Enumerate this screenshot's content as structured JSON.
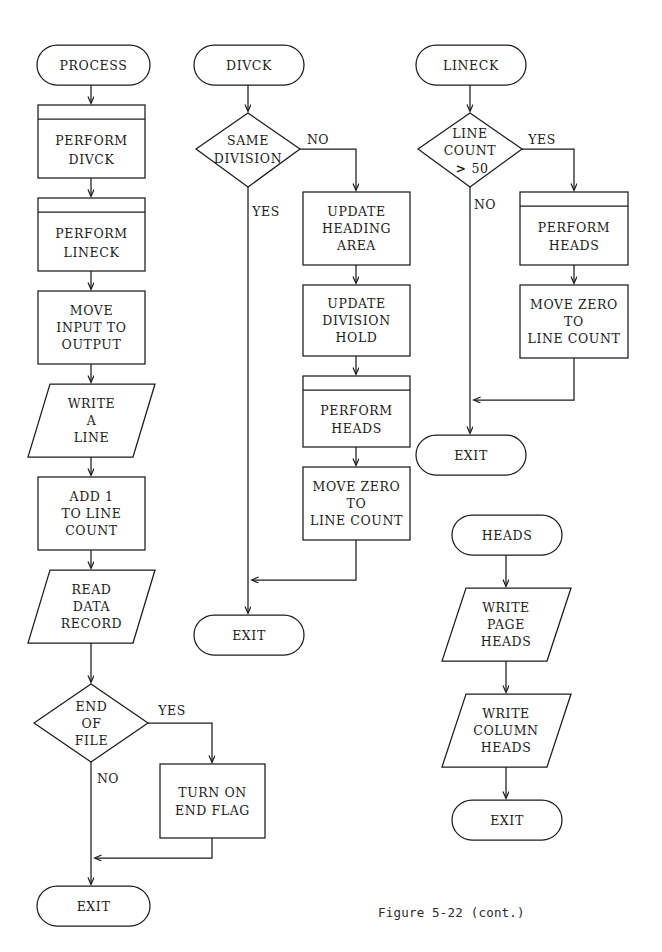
{
  "figure": {
    "caption": "Figure 5-22 (cont.)",
    "caption_x": 378,
    "caption_y": 905
  },
  "chart_data": {
    "type": "diagram",
    "diagram_kind": "flowchart",
    "title": "Figure 5-22 (cont.)",
    "shape_legend": {
      "terminal": "rounded stadium = routine entry / EXIT",
      "process": "rectangle = processing step",
      "predefined_process": "rectangle with top bar = PERFORM (subroutine call)",
      "io": "parallelogram = input/output (READ/WRITE)",
      "decision": "diamond = conditional branch"
    },
    "routines": [
      {
        "name": "PROCESS",
        "column": 1,
        "nodes": [
          {
            "id": "p_start",
            "type": "terminal",
            "lines": [
              "PROCESS"
            ]
          },
          {
            "id": "p_divck",
            "type": "predefined_process",
            "lines": [
              "PERFORM",
              "DIVCK"
            ]
          },
          {
            "id": "p_lineck",
            "type": "predefined_process",
            "lines": [
              "PERFORM",
              "LINECK"
            ]
          },
          {
            "id": "p_move",
            "type": "process",
            "lines": [
              "MOVE",
              "INPUT TO",
              "OUTPUT"
            ]
          },
          {
            "id": "p_write",
            "type": "io",
            "lines": [
              "WRITE",
              "A",
              "LINE"
            ]
          },
          {
            "id": "p_add",
            "type": "process",
            "lines": [
              "ADD 1",
              "TO LINE",
              "COUNT"
            ]
          },
          {
            "id": "p_read",
            "type": "io",
            "lines": [
              "READ",
              "DATA",
              "RECORD"
            ]
          },
          {
            "id": "p_eof",
            "type": "decision",
            "lines": [
              "END",
              "OF",
              "FILE"
            ]
          },
          {
            "id": "p_flag",
            "type": "process",
            "lines": [
              "TURN ON",
              "END FLAG"
            ]
          },
          {
            "id": "p_exit",
            "type": "terminal",
            "lines": [
              "EXIT"
            ]
          }
        ],
        "edges": [
          {
            "from": "p_start",
            "to": "p_divck",
            "label": ""
          },
          {
            "from": "p_divck",
            "to": "p_lineck",
            "label": ""
          },
          {
            "from": "p_lineck",
            "to": "p_move",
            "label": ""
          },
          {
            "from": "p_move",
            "to": "p_write",
            "label": ""
          },
          {
            "from": "p_write",
            "to": "p_add",
            "label": ""
          },
          {
            "from": "p_add",
            "to": "p_read",
            "label": ""
          },
          {
            "from": "p_read",
            "to": "p_eof",
            "label": ""
          },
          {
            "from": "p_eof",
            "to": "p_flag",
            "label": "YES"
          },
          {
            "from": "p_eof",
            "to": "p_exit",
            "label": "NO"
          },
          {
            "from": "p_flag",
            "to": "p_exit",
            "label": ""
          }
        ]
      },
      {
        "name": "DIVCK",
        "column": 2,
        "nodes": [
          {
            "id": "d_start",
            "type": "terminal",
            "lines": [
              "DIVCK"
            ]
          },
          {
            "id": "d_same",
            "type": "decision",
            "lines": [
              "SAME",
              "DIVISION"
            ]
          },
          {
            "id": "d_head",
            "type": "process",
            "lines": [
              "UPDATE",
              "HEADING",
              "AREA"
            ]
          },
          {
            "id": "d_hold",
            "type": "process",
            "lines": [
              "UPDATE",
              "DIVISION",
              "HOLD"
            ]
          },
          {
            "id": "d_heads",
            "type": "predefined_process",
            "lines": [
              "PERFORM",
              "HEADS"
            ]
          },
          {
            "id": "d_zero",
            "type": "process",
            "lines": [
              "MOVE ZERO",
              "TO",
              "LINE COUNT"
            ]
          },
          {
            "id": "d_exit",
            "type": "terminal",
            "lines": [
              "EXIT"
            ]
          }
        ],
        "edges": [
          {
            "from": "d_start",
            "to": "d_same",
            "label": ""
          },
          {
            "from": "d_same",
            "to": "d_head",
            "label": "NO"
          },
          {
            "from": "d_same",
            "to": "d_exit",
            "label": "YES"
          },
          {
            "from": "d_head",
            "to": "d_hold",
            "label": ""
          },
          {
            "from": "d_hold",
            "to": "d_heads",
            "label": ""
          },
          {
            "from": "d_heads",
            "to": "d_zero",
            "label": ""
          },
          {
            "from": "d_zero",
            "to": "d_exit",
            "label": ""
          }
        ]
      },
      {
        "name": "LINECK",
        "column": 3,
        "nodes": [
          {
            "id": "l_start",
            "type": "terminal",
            "lines": [
              "LINECK"
            ]
          },
          {
            "id": "l_cnt",
            "type": "decision",
            "lines": [
              "LINE",
              "COUNT",
              "> 50"
            ]
          },
          {
            "id": "l_heads",
            "type": "predefined_process",
            "lines": [
              "PERFORM",
              "HEADS"
            ]
          },
          {
            "id": "l_zero",
            "type": "process",
            "lines": [
              "MOVE ZERO",
              "TO",
              "LINE COUNT"
            ]
          },
          {
            "id": "l_exit",
            "type": "terminal",
            "lines": [
              "EXIT"
            ]
          }
        ],
        "edges": [
          {
            "from": "l_start",
            "to": "l_cnt",
            "label": ""
          },
          {
            "from": "l_cnt",
            "to": "l_heads",
            "label": "YES"
          },
          {
            "from": "l_cnt",
            "to": "l_exit",
            "label": "NO"
          },
          {
            "from": "l_heads",
            "to": "l_zero",
            "label": ""
          },
          {
            "from": "l_zero",
            "to": "l_exit",
            "label": ""
          }
        ]
      },
      {
        "name": "HEADS",
        "column": 3,
        "nodes": [
          {
            "id": "h_start",
            "type": "terminal",
            "lines": [
              "HEADS"
            ]
          },
          {
            "id": "h_page",
            "type": "io",
            "lines": [
              "WRITE",
              "PAGE",
              "HEADS"
            ]
          },
          {
            "id": "h_col",
            "type": "io",
            "lines": [
              "WRITE",
              "COLUMN",
              "HEADS"
            ]
          },
          {
            "id": "h_exit",
            "type": "terminal",
            "lines": [
              "EXIT"
            ]
          }
        ],
        "edges": [
          {
            "from": "h_start",
            "to": "h_page",
            "label": ""
          },
          {
            "from": "h_page",
            "to": "h_col",
            "label": ""
          },
          {
            "from": "h_col",
            "to": "h_exit",
            "label": ""
          }
        ]
      }
    ]
  },
  "nodes": {
    "p_start": {
      "label": "PROCESS"
    },
    "p_divck": {
      "l1": "PERFORM",
      "l2": "DIVCK"
    },
    "p_lineck": {
      "l1": "PERFORM",
      "l2": "LINECK"
    },
    "p_move": {
      "l1": "MOVE",
      "l2": "INPUT TO",
      "l3": "OUTPUT"
    },
    "p_write": {
      "l1": "WRITE",
      "l2": "A",
      "l3": "LINE"
    },
    "p_add": {
      "l1": "ADD 1",
      "l2": "TO LINE",
      "l3": "COUNT"
    },
    "p_read": {
      "l1": "READ",
      "l2": "DATA",
      "l3": "RECORD"
    },
    "p_eof": {
      "l1": "END",
      "l2": "OF",
      "l3": "FILE"
    },
    "p_flag": {
      "l1": "TURN ON",
      "l2": "END FLAG"
    },
    "p_exit": {
      "label": "EXIT"
    },
    "d_start": {
      "label": "DIVCK"
    },
    "d_same": {
      "l1": "SAME",
      "l2": "DIVISION"
    },
    "d_head": {
      "l1": "UPDATE",
      "l2": "HEADING",
      "l3": "AREA"
    },
    "d_hold": {
      "l1": "UPDATE",
      "l2": "DIVISION",
      "l3": "HOLD"
    },
    "d_heads": {
      "l1": "PERFORM",
      "l2": "HEADS"
    },
    "d_zero": {
      "l1": "MOVE ZERO",
      "l2": "TO",
      "l3": "LINE COUNT"
    },
    "d_exit": {
      "label": "EXIT"
    },
    "l_start": {
      "label": "LINECK"
    },
    "l_cnt": {
      "l1": "LINE",
      "l2": "COUNT",
      "l3gt": ">",
      "l3num": "50"
    },
    "l_heads": {
      "l1": "PERFORM",
      "l2": "HEADS"
    },
    "l_zero": {
      "l1": "MOVE ZERO",
      "l2": "TO",
      "l3": "LINE COUNT"
    },
    "l_exit": {
      "label": "EXIT"
    },
    "h_start": {
      "label": "HEADS"
    },
    "h_page": {
      "l1": "WRITE",
      "l2": "PAGE",
      "l3": "HEADS"
    },
    "h_col": {
      "l1": "WRITE",
      "l2": "COLUMN",
      "l3": "HEADS"
    },
    "h_exit": {
      "label": "EXIT"
    }
  },
  "branch_labels": {
    "eof_yes": "YES",
    "eof_no": "NO",
    "same_no": "NO",
    "same_yes": "YES",
    "cnt_yes": "YES",
    "cnt_no": "NO"
  },
  "colors": {
    "ink": "#1c1c1c",
    "paper": "#ffffff"
  }
}
